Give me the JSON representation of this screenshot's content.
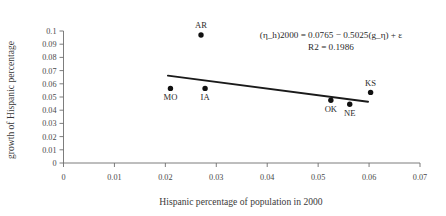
{
  "chart_data": {
    "type": "scatter",
    "title": "",
    "xlabel": "Hispanic percentage of population in 2000",
    "ylabel": "growth of Hispanic percentage",
    "xlim": [
      0,
      0.07
    ],
    "ylim": [
      0,
      0.1
    ],
    "xticks": [
      "0",
      "0.01",
      "0.02",
      "0.03",
      "0.04",
      "0.05",
      "0.06",
      "0.07"
    ],
    "xtick_values": [
      0,
      0.01,
      0.02,
      0.03,
      0.04,
      0.05,
      0.06,
      0.07
    ],
    "yticks": [
      "0",
      "0.01",
      "0.02",
      "0.03",
      "0.04",
      "0.05",
      "0.06",
      "0.07",
      "0.08",
      "0.09",
      "0.1"
    ],
    "ytick_values": [
      0,
      0.01,
      0.02,
      0.03,
      0.04,
      0.05,
      0.06,
      0.07,
      0.08,
      0.09,
      0.1
    ],
    "grid": false,
    "legend": "none",
    "points": [
      {
        "label": "AR",
        "x": 0.027,
        "y": 0.097,
        "label_pos": "above"
      },
      {
        "label": "MO",
        "x": 0.021,
        "y": 0.0565,
        "label_pos": "below"
      },
      {
        "label": "IA",
        "x": 0.0278,
        "y": 0.0565,
        "label_pos": "below"
      },
      {
        "label": "OK",
        "x": 0.0525,
        "y": 0.0475,
        "label_pos": "below"
      },
      {
        "label": "NE",
        "x": 0.0562,
        "y": 0.0445,
        "label_pos": "below"
      },
      {
        "label": "KS",
        "x": 0.0603,
        "y": 0.0535,
        "label_pos": "above"
      }
    ],
    "trendline": {
      "intercept": 0.0765,
      "slope": -0.5025,
      "x_start": 0.0205,
      "x_end": 0.0598,
      "equation": "(η_h)2000 = 0.0765 − 0.5025(g_η) + ε",
      "r2_label": "R2 = 0.1986",
      "r2_value": 0.1986
    },
    "annotations": [
      "(η_h)2000 = 0.0765 − 0.5025(g_η) + ε",
      "R2 = 0.1986"
    ]
  }
}
